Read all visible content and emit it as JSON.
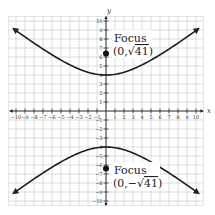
{
  "chart_data": {
    "type": "line",
    "title": "",
    "xlabel": "x",
    "ylabel": "y",
    "xlim": [
      -10.8,
      10.8
    ],
    "ylim": [
      -10.5,
      10.5
    ],
    "grid": true,
    "x_ticks": [
      -10,
      -9,
      -8,
      -7,
      -6,
      -5,
      -4,
      -3,
      -2,
      -1,
      1,
      2,
      3,
      4,
      5,
      6,
      7,
      8,
      9,
      10
    ],
    "y_ticks": [
      -10,
      -9,
      -8,
      -7,
      -6,
      -5,
      -4,
      -3,
      -2,
      -1,
      1,
      2,
      3,
      4,
      5,
      6,
      7,
      8,
      9,
      10
    ],
    "equation": "y^2/16 - x^2/25 = 1",
    "series": [
      {
        "name": "upper branch",
        "x": [
          -10,
          -8,
          -6,
          -4,
          -2,
          0,
          2,
          4,
          6,
          8,
          10
        ],
        "y": [
          8.94,
          7.55,
          6.25,
          5.12,
          4.31,
          4.0,
          4.31,
          5.12,
          6.25,
          7.55,
          8.94
        ]
      },
      {
        "name": "lower branch",
        "x": [
          -10,
          -8,
          -6,
          -4,
          -2,
          0,
          2,
          4,
          6,
          8,
          10
        ],
        "y": [
          -8.94,
          -7.55,
          -6.25,
          -5.12,
          -4.31,
          -4.0,
          -4.31,
          -5.12,
          -6.25,
          -7.55,
          -8.94
        ]
      }
    ],
    "points": [
      {
        "name": "upper focus",
        "x": 0,
        "y": 6.4
      },
      {
        "name": "lower focus",
        "x": 0,
        "y": -6.4
      }
    ],
    "annotations": [
      {
        "title": "Focus",
        "coords": "(0, √41)"
      },
      {
        "title": "Focus",
        "coords": "(0, −√41)"
      }
    ]
  },
  "labels": {
    "x_axis": "x",
    "y_axis": "y",
    "upper_focus_title": "Focus",
    "upper_focus_open": "(0,",
    "upper_focus_radicand": "41",
    "upper_focus_close": ")",
    "lower_focus_title": "Focus",
    "lower_focus_open": "(0,−",
    "lower_focus_radicand": "41",
    "lower_focus_close": ")"
  }
}
